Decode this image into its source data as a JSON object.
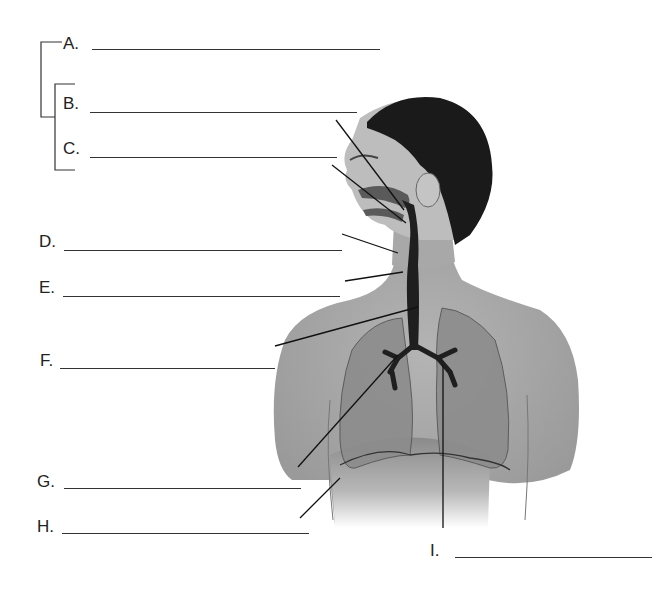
{
  "diagram": {
    "labels": [
      {
        "letter": "A.",
        "answer": ""
      },
      {
        "letter": "B.",
        "answer": ""
      },
      {
        "letter": "C.",
        "answer": ""
      },
      {
        "letter": "D.",
        "answer": ""
      },
      {
        "letter": "E.",
        "answer": ""
      },
      {
        "letter": "F.",
        "answer": ""
      },
      {
        "letter": "G.",
        "answer": ""
      },
      {
        "letter": "H.",
        "answer": ""
      },
      {
        "letter": "I.",
        "answer": ""
      }
    ],
    "bracket_groups": [
      {
        "group": "A",
        "contains": [
          "B",
          "C"
        ]
      }
    ]
  }
}
